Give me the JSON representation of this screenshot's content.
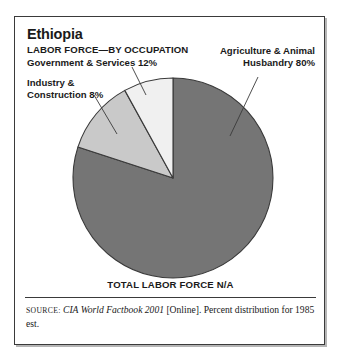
{
  "figure": {
    "country": "Ethiopia",
    "subject": "LABOR FORCE—BY OCCUPATION",
    "total_caption": "TOTAL LABOR FORCE N/A"
  },
  "labels": {
    "government": "Government & Services 12%",
    "industry": "Industry &\nConstruction 8%",
    "agriculture": "Agriculture & Animal\nHusbandry 80%"
  },
  "source": {
    "label": "SOURCE:",
    "work": "CIA World Factbook 2001",
    "rest": " [Online]. Percent distribution for 1985 est."
  },
  "colors": {
    "agriculture": "#757575",
    "government": "#c9c9c9",
    "industry": "#f0f0f0",
    "outline": "#3a3a3a",
    "frame": "#3a3a3a",
    "background": "#ffffff",
    "text": "#1a1a1a"
  },
  "chart_data": {
    "type": "pie",
    "subtitle": "TOTAL LABOR FORCE N/A",
    "unit": "percent",
    "legend": "none",
    "grid": false,
    "start_angle_deg": 90,
    "direction": "clockwise",
    "categories": [
      "Agriculture & Animal Husbandry",
      "Government & Services",
      "Industry & Construction"
    ],
    "values": [
      80,
      12,
      8
    ],
    "slices": [
      {
        "label": "Agriculture & Animal Husbandry 80%",
        "category": "Agriculture & Animal Husbandry",
        "value": 80,
        "color": "#757575",
        "sweep_deg": 288
      },
      {
        "label": "Government & Services 12%",
        "category": "Government & Services",
        "value": 12,
        "color": "#c9c9c9",
        "sweep_deg": 43.2
      },
      {
        "label": "Industry & Construction 8%",
        "category": "Industry & Construction",
        "value": 8,
        "color": "#f0f0f0",
        "sweep_deg": 28.8
      }
    ],
    "annotations": [
      "TOTAL LABOR FORCE N/A",
      "SOURCE: CIA World Factbook 2001 [Online]. Percent distribution for 1985 est."
    ]
  }
}
